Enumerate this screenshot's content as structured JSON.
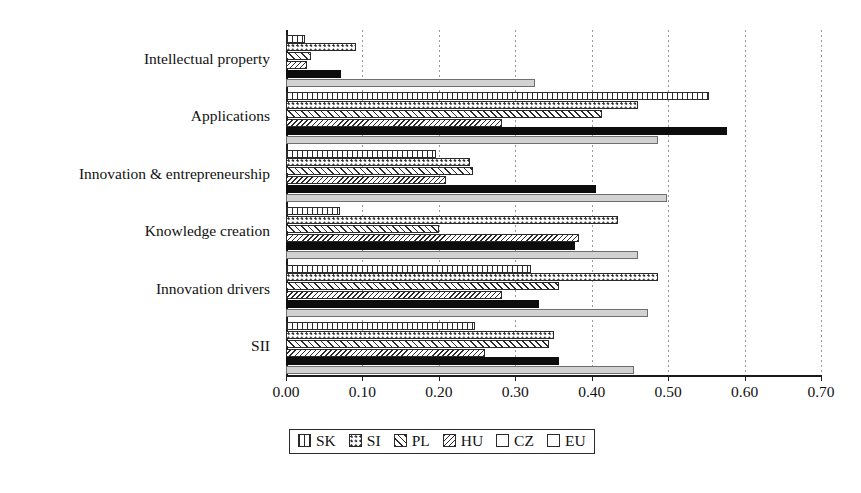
{
  "chart_data": {
    "type": "bar",
    "orientation": "horizontal",
    "title": "",
    "subtitle": "",
    "xlabel": "",
    "ylabel": "",
    "xlim": [
      0.0,
      0.7
    ],
    "grid": true,
    "legend_position": "bottom",
    "categories": [
      "Intellectual property",
      "Applications",
      "Innovation & entrepreneurship",
      "Knowledge creation",
      "Innovation drivers",
      "SII"
    ],
    "tick_labels": [
      "0.00",
      "0.10",
      "0.20",
      "0.30",
      "0.40",
      "0.50",
      "0.60",
      "0.70"
    ],
    "tick_values": [
      0.0,
      0.1,
      0.2,
      0.3,
      0.4,
      0.5,
      0.6,
      0.7
    ],
    "series": [
      {
        "name": "SK",
        "pattern": "vertical-dash",
        "color": "#ffffff",
        "values": [
          0.025,
          0.553,
          0.196,
          0.07,
          0.32,
          0.247
        ]
      },
      {
        "name": "SI",
        "pattern": "dotted",
        "color": "#ffffff",
        "values": [
          0.092,
          0.461,
          0.241,
          0.435,
          0.487,
          0.35
        ]
      },
      {
        "name": "PL",
        "pattern": "forward-hatch",
        "color": "#ffffff",
        "values": [
          0.033,
          0.413,
          0.245,
          0.2,
          0.357,
          0.344
        ]
      },
      {
        "name": "HU",
        "pattern": "back-hatch",
        "color": "#ffffff",
        "values": [
          0.027,
          0.282,
          0.209,
          0.383,
          0.282,
          0.26
        ]
      },
      {
        "name": "CZ",
        "pattern": "solid",
        "color": "#0d0d0d",
        "values": [
          0.072,
          0.577,
          0.405,
          0.378,
          0.331,
          0.357
        ]
      },
      {
        "name": "EU",
        "pattern": "light-grey",
        "color": "#d2d2d2",
        "values": [
          0.326,
          0.487,
          0.498,
          0.461,
          0.474,
          0.455
        ]
      }
    ]
  },
  "legend": {
    "items": [
      {
        "label": "SK"
      },
      {
        "label": "SI"
      },
      {
        "label": "PL"
      },
      {
        "label": "HU"
      },
      {
        "label": "CZ"
      },
      {
        "label": "EU"
      }
    ]
  }
}
